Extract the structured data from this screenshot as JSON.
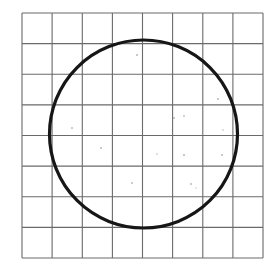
{
  "figure": {
    "kind": "geometric-line-drawing",
    "medium": "scanned hand-drawn figure",
    "canvas": {
      "width": 276,
      "height": 271,
      "background_color": "#ffffff"
    },
    "grid": {
      "name": "square-grid",
      "columns": 8,
      "rows": 8,
      "left": 22,
      "top": 13,
      "right": 263,
      "bottom": 258,
      "width": 241,
      "height": 245,
      "cell_width": 30.125,
      "cell_height": 30.625,
      "line_color": "#6a6a6a",
      "line_width": 1.1,
      "vertical_line_x": [
        22,
        52.1,
        82.3,
        112.4,
        142.5,
        172.6,
        202.8,
        232.9,
        263
      ],
      "horizontal_line_y": [
        13,
        43.6,
        74.3,
        104.9,
        135.5,
        166.1,
        196.8,
        227.4,
        258
      ]
    },
    "circle": {
      "name": "circle-outline",
      "center_x": 143.5,
      "center_y": 134,
      "radius": 94,
      "diameter": 188,
      "left_extent_x": 49,
      "right_extent_x": 238,
      "top_extent_y": 40,
      "bottom_extent_y": 228,
      "stroke_color": "#161616",
      "stroke_width": 3.2,
      "fill": "none",
      "radius_in_cells": 3.1
    },
    "speckles": {
      "name": "scan-speckles",
      "color": "#b9b9b9",
      "points": [
        {
          "x": 137,
          "y": 55,
          "r": 1.0
        },
        {
          "x": 171,
          "y": 43,
          "r": 0.7
        },
        {
          "x": 218,
          "y": 99,
          "r": 1.0
        },
        {
          "x": 174,
          "y": 118,
          "r": 1.1
        },
        {
          "x": 184,
          "y": 116,
          "r": 0.9
        },
        {
          "x": 72,
          "y": 128,
          "r": 1.0
        },
        {
          "x": 223,
          "y": 130,
          "r": 0.8
        },
        {
          "x": 101,
          "y": 148,
          "r": 1.0
        },
        {
          "x": 157,
          "y": 154,
          "r": 0.8
        },
        {
          "x": 184,
          "y": 155,
          "r": 1.1
        },
        {
          "x": 222,
          "y": 155,
          "r": 1.0
        },
        {
          "x": 132,
          "y": 183,
          "r": 0.9
        },
        {
          "x": 191,
          "y": 184,
          "r": 1.0
        },
        {
          "x": 196,
          "y": 188,
          "r": 0.7
        }
      ]
    }
  },
  "chart_data": {
    "type": "line",
    "xlabel": "",
    "ylabel": "",
    "grid": true,
    "legend": "none",
    "xlim": [
      0,
      8
    ],
    "ylim": [
      0,
      8
    ],
    "xticks": [
      0,
      1,
      2,
      3,
      4,
      5,
      6,
      7,
      8
    ],
    "yticks": [
      0,
      1,
      2,
      3,
      4,
      5,
      6,
      7,
      8
    ],
    "tick_labels": [],
    "series": [
      {
        "name": "circle",
        "shape": "circle",
        "center_in_grid_units": [
          4.03,
          3.95
        ],
        "radius_in_grid_units": 3.1,
        "stroke_color": "#161616"
      }
    ],
    "annotations": []
  }
}
